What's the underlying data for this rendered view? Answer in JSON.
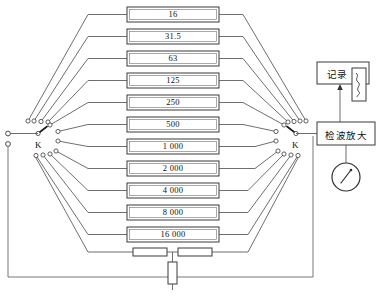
{
  "diagram": {
    "filter_blocks": [
      {
        "label": "16"
      },
      {
        "label": "31.5"
      },
      {
        "label": "63"
      },
      {
        "label": "125"
      },
      {
        "label": "250"
      },
      {
        "label": "500"
      },
      {
        "label": "1 000"
      },
      {
        "label": "2 000"
      },
      {
        "label": "4 000"
      },
      {
        "label": "8 000"
      },
      {
        "label": "16 000"
      }
    ],
    "switches": [
      {
        "name": "left-switch",
        "label": "K"
      },
      {
        "name": "right-switch",
        "label": "K"
      }
    ],
    "units": {
      "recorder": "记录",
      "detector_amplifier": "检波放大"
    },
    "colors": {
      "line": "#4a4a4a",
      "box_border": "#3b3b3b",
      "text": "#111111",
      "background": "#ffffff"
    }
  }
}
